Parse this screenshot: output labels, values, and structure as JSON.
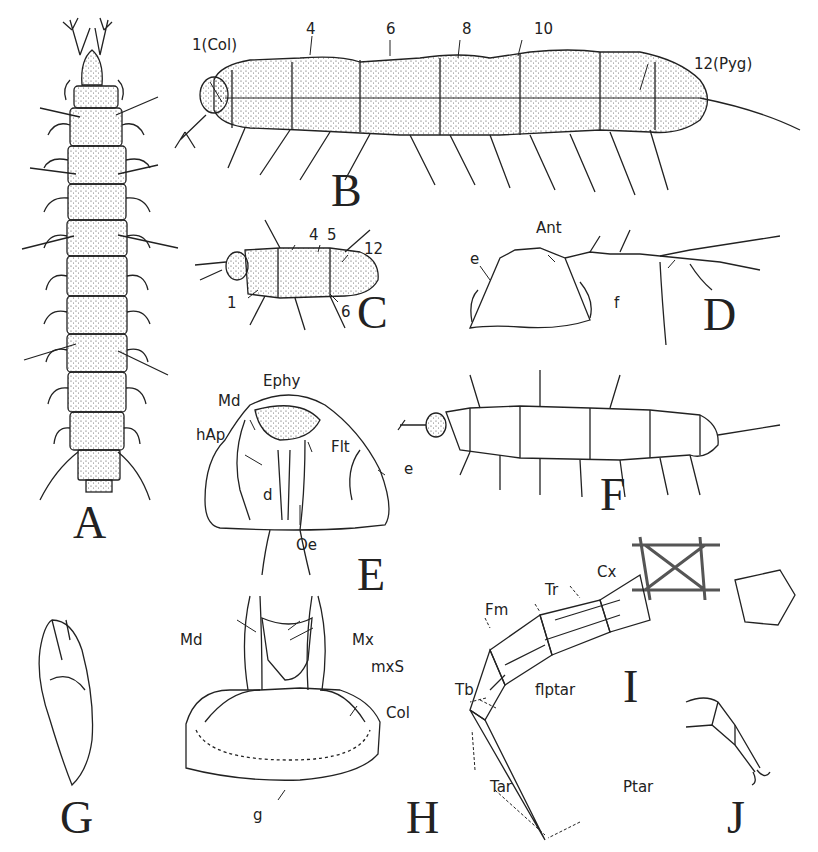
{
  "figure": {
    "panels": [
      {
        "id": "A",
        "letter": "A",
        "description": "Dorsal view of whole animal"
      },
      {
        "id": "B",
        "letter": "B",
        "description": "Lateral view of adult",
        "labels": [
          "1(Col)",
          "4",
          "6",
          "8",
          "10",
          "12(Pyg)"
        ]
      },
      {
        "id": "C",
        "letter": "C",
        "description": "Lateral view of young individual",
        "labels": [
          "4",
          "5",
          "12",
          "1",
          "6"
        ]
      },
      {
        "id": "D",
        "letter": "D",
        "description": "Head with antenna",
        "labels": [
          "Ant",
          "e",
          "f"
        ]
      },
      {
        "id": "E",
        "letter": "E",
        "description": "Head, internal view",
        "labels": [
          "Ephy",
          "Md",
          "hAp",
          "Flt",
          "e",
          "d",
          "Oe"
        ]
      },
      {
        "id": "F",
        "letter": "F",
        "description": "Lateral view of juvenile"
      },
      {
        "id": "G",
        "letter": "G",
        "description": "Mandible"
      },
      {
        "id": "H",
        "letter": "H",
        "description": "Mouthparts ventral view",
        "labels": [
          "Md",
          "Mx",
          "mxS",
          "Col",
          "g"
        ]
      },
      {
        "id": "I",
        "letter": "I",
        "description": "Leg musculature",
        "labels": [
          "Cx",
          "Tr",
          "Fm",
          "Tb",
          "flptar",
          "Tar",
          "Ptar"
        ]
      },
      {
        "id": "J",
        "letter": "J",
        "description": "Leg tip"
      }
    ]
  },
  "labels": {
    "b": {
      "col": "1(Col)",
      "n4": "4",
      "n6": "6",
      "n8": "8",
      "n10": "10",
      "pyg": "12(Pyg)"
    },
    "c": {
      "n4": "4",
      "n5": "5",
      "n12": "12",
      "n1": "1",
      "n6": "6"
    },
    "d": {
      "ant": "Ant",
      "e": "e",
      "f": "f"
    },
    "e": {
      "ephy": "Ephy",
      "md": "Md",
      "hap": "hAp",
      "flt": "Flt",
      "e": "e",
      "d": "d",
      "oe": "Oe"
    },
    "h": {
      "md": "Md",
      "mx": "Mx",
      "mxs": "mxS",
      "col": "Col",
      "g": "g"
    },
    "i": {
      "cx": "Cx",
      "tr": "Tr",
      "fm": "Fm",
      "tb": "Tb",
      "flptar": "flptar",
      "tar": "Tar",
      "ptar": "Ptar"
    }
  },
  "colors": {
    "ink": "#222222",
    "paper": "#ffffff"
  }
}
